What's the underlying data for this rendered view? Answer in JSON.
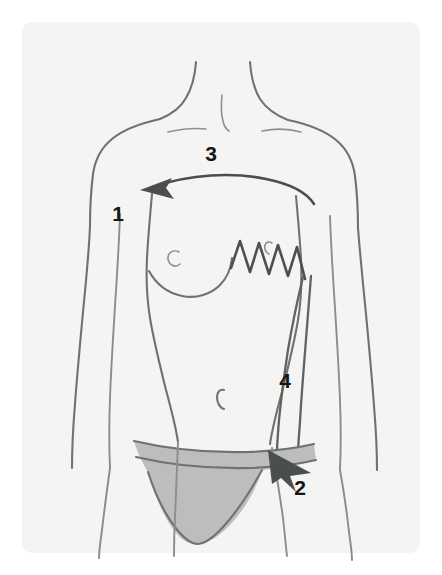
{
  "figure": {
    "background_color": "#ffffff",
    "panel_color": "#f4f4f2",
    "line_color": "#6f7272",
    "ink_color": "#4a4e4e",
    "garment_color": "#bdbdbd",
    "label_color": "#151515"
  },
  "labels": [
    {
      "id": "label-1",
      "text": "1",
      "x": 118,
      "y": 221,
      "refers_to": "reconstructed-breast-recipient-site"
    },
    {
      "id": "label-2",
      "text": "2",
      "x": 300,
      "y": 495,
      "refers_to": "hip-donor-site"
    },
    {
      "id": "label-3",
      "text": "3",
      "x": 211,
      "y": 161,
      "refers_to": "upper-chest-sternal-region"
    },
    {
      "id": "label-4",
      "text": "4",
      "x": 285,
      "y": 388,
      "refers_to": "flap-pedicle-tunnel"
    }
  ],
  "annotations": {
    "transfer_arrow": {
      "name": "tissue-transfer-arrow",
      "direction": "right-to-left",
      "from": "lateral-chest",
      "to": "left-breast-site"
    },
    "donor_arrow": {
      "name": "donor-site-arrow",
      "direction": "down-right",
      "at": "hip"
    },
    "suture": {
      "name": "zigzag-suture-line",
      "peaks": 4,
      "location": "right-chest-mastectomy-site"
    }
  },
  "anatomy_marks": [
    {
      "name": "sternal-notch",
      "label": "sternal notch"
    },
    {
      "name": "left-clavicle",
      "label": "clavicle"
    },
    {
      "name": "right-clavicle",
      "label": "clavicle"
    },
    {
      "name": "left-nipple",
      "label": "nipple"
    },
    {
      "name": "navel",
      "label": "navel"
    }
  ],
  "garment": {
    "name": "underwear",
    "label": "briefs"
  }
}
